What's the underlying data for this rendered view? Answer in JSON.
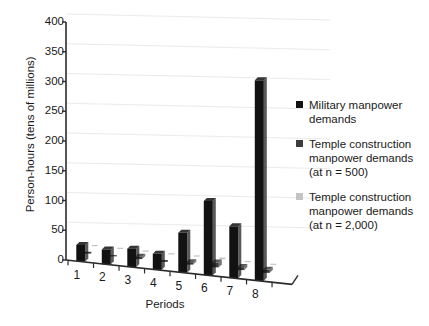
{
  "chart_data": {
    "type": "bar",
    "title": "",
    "subtitle": "",
    "xlabel": "Periods",
    "ylabel": "Person-hours (tens of millions)",
    "categories": [
      "1",
      "2",
      "3",
      "4",
      "5",
      "6",
      "7",
      "8"
    ],
    "ylim": [
      0,
      400
    ],
    "ytick_values": [
      0,
      50,
      100,
      150,
      200,
      250,
      300,
      350,
      400
    ],
    "ytick_labels": [
      "0",
      "50",
      "100",
      "150",
      "200",
      "250",
      "300",
      "350",
      "400"
    ],
    "grid": true,
    "grid_axis": "y",
    "legend_position": "right",
    "projection": "3d-perspective",
    "series": [
      {
        "name": "Military manpower demands",
        "color": "#121212",
        "values": [
          28,
          25,
          31,
          27,
          67,
          125,
          87,
          337
        ]
      },
      {
        "name": "Temple construction manpower demands (at n = 500)",
        "color": "#3d3d3d",
        "values": [
          3,
          2,
          4,
          3,
          4,
          8,
          5,
          5
        ]
      },
      {
        "name": "Temple construction manpower demands (at n = 2,000)",
        "color": "#c4c4c4",
        "values": [
          1,
          1,
          1,
          1,
          2,
          3,
          2,
          2
        ]
      }
    ]
  },
  "axes": {
    "y_title": "Person-hours (tens of millions)",
    "x_title": "Periods"
  },
  "legend": {
    "entries": [
      {
        "label": "Military manpower\ndemands",
        "color": "#121212",
        "swatch_name": "legend-swatch-military"
      },
      {
        "label": "Temple construction\nmanpower demands\n(at n = 500)",
        "color": "#3d3d3d",
        "swatch_name": "legend-swatch-temple-500"
      },
      {
        "label": "Temple construction\nmanpower demands\n(at n = 2,000)",
        "color": "#c4c4c4",
        "swatch_name": "legend-swatch-temple-2000"
      }
    ]
  }
}
